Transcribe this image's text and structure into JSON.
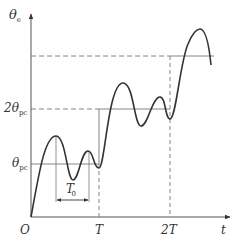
{
  "diagram": {
    "type": "step-response-curve",
    "y_axis": {
      "symbol": "θ",
      "subscript": "e"
    },
    "x_axis": {
      "symbol": "t"
    },
    "origin_label": "O",
    "x_ticks": [
      {
        "label": "T",
        "x": 99
      },
      {
        "label": "2T",
        "x": 170
      }
    ],
    "y_levels": [
      {
        "label_prefix": "",
        "symbol": "θ",
        "subscript": "pc",
        "y": 164,
        "style": "solid"
      },
      {
        "label_prefix": "2",
        "symbol": "θ",
        "subscript": "pc",
        "y": 109,
        "style": "dashed-then-solid"
      },
      {
        "label_prefix": "",
        "symbol": "",
        "subscript": "",
        "y": 56,
        "style": "dashed-then-solid"
      }
    ],
    "period_annotation": {
      "symbol": "T",
      "superscript": "′",
      "subscript": "0"
    },
    "colors": {
      "curve": "#333333",
      "axes": "#555555",
      "guides": "#777777",
      "background": "#ffffff"
    }
  }
}
